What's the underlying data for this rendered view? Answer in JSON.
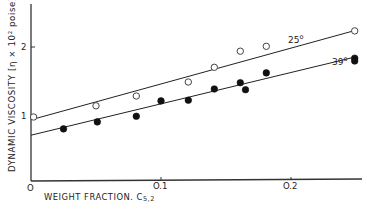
{
  "chart_data": {
    "type": "scatter",
    "title": "",
    "xlabel": "WEIGHT FRACTION, C",
    "xlabel_subscript": "5,2",
    "ylabel": "DYNAMIC VISCOSITY [η × 10² poise]",
    "xlim": [
      0,
      0.25
    ],
    "ylim": [
      0,
      2.6
    ],
    "x_ticks": [
      0,
      0.1,
      0.2
    ],
    "x_tick_labels": [
      "O",
      "O.1",
      "O.2"
    ],
    "y_ticks": [
      1,
      2
    ],
    "y_tick_labels": [
      "1",
      "2"
    ],
    "grid": false,
    "legend": "inline line labels",
    "series": [
      {
        "name": "25°",
        "marker": "open-circle",
        "points": [
          {
            "x": 0.002,
            "y": 1.0
          },
          {
            "x": 0.05,
            "y": 1.16
          },
          {
            "x": 0.081,
            "y": 1.3
          },
          {
            "x": 0.121,
            "y": 1.5
          },
          {
            "x": 0.141,
            "y": 1.71
          },
          {
            "x": 0.161,
            "y": 1.94
          },
          {
            "x": 0.181,
            "y": 2.01
          },
          {
            "x": 0.249,
            "y": 2.23
          }
        ],
        "fit_line": {
          "x0": 0,
          "y0": 0.96,
          "x1": 0.25,
          "y1": 2.24
        }
      },
      {
        "name": "39°",
        "marker": "filled-circle",
        "points": [
          {
            "x": 0.025,
            "y": 0.83
          },
          {
            "x": 0.051,
            "y": 0.93
          },
          {
            "x": 0.081,
            "y": 1.01
          },
          {
            "x": 0.1,
            "y": 1.23
          },
          {
            "x": 0.121,
            "y": 1.24
          },
          {
            "x": 0.141,
            "y": 1.4
          },
          {
            "x": 0.161,
            "y": 1.49
          },
          {
            "x": 0.165,
            "y": 1.39
          },
          {
            "x": 0.181,
            "y": 1.63
          },
          {
            "x": 0.249,
            "y": 1.84
          },
          {
            "x": 0.249,
            "y": 1.8
          }
        ],
        "fit_line": {
          "x0": 0,
          "y0": 0.74,
          "x1": 0.25,
          "y1": 1.86
        }
      }
    ]
  },
  "labels": {
    "ylabel": "DYNAMIC VISCOSITY [η × 10² poise]",
    "xlabel_main": "WEIGHT FRACTION. C",
    "xlabel_sub": "5,2",
    "origin": "O",
    "xtick_1": "O.1",
    "xtick_2": "O.2",
    "ytick_1": "1",
    "ytick_2": "2",
    "line_25": "25",
    "line_39": "39",
    "degree": "o"
  }
}
